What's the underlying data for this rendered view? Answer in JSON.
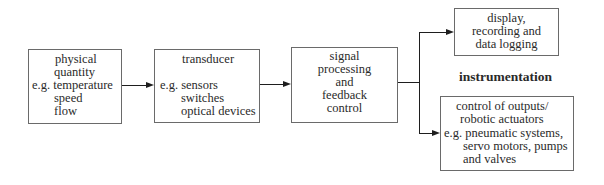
{
  "diagram": {
    "type": "block-diagram",
    "nodes": {
      "input": {
        "lines": [
          "physical",
          "quantity",
          "e.g. temperature",
          "speed",
          "flow"
        ]
      },
      "transducer": {
        "title": "transducer",
        "lines": [
          "e.g. sensors",
          "switches",
          "optical devices"
        ]
      },
      "processing": {
        "lines": [
          "signal",
          "processing",
          "and",
          "feedback",
          "control"
        ]
      },
      "display": {
        "lines": [
          "display,",
          "recording and",
          "data logging"
        ]
      },
      "control": {
        "lines": [
          "control of outputs/",
          "robotic actuators",
          "e.g. pneumatic systems,",
          "servo motors, pumps",
          "and valves"
        ]
      }
    },
    "label_instrumentation": "instrumentation",
    "edges": [
      {
        "from": "input",
        "to": "transducer"
      },
      {
        "from": "transducer",
        "to": "processing"
      },
      {
        "from": "processing",
        "to": "display"
      },
      {
        "from": "processing",
        "to": "control"
      }
    ]
  }
}
